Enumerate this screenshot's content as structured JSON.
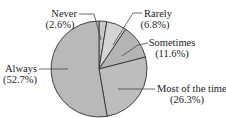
{
  "chart_data": {
    "type": "pie",
    "title": "",
    "categories": [
      "Never",
      "Rarely",
      "Sometimes",
      "Most of the time",
      "Always"
    ],
    "values": [
      2.6,
      6.8,
      11.6,
      26.3,
      52.7
    ],
    "unit": "%",
    "start_angle": "top (12 o'clock)",
    "direction": "clockwise",
    "colors": [
      "#c8c8c8",
      "#d4d4d4",
      "#b4b4b4",
      "#bdbdbd",
      "#b9b9b9"
    ],
    "edge_color": "#333333",
    "legend": "none (callout labels)",
    "labels": [
      {
        "name": "Never",
        "pct": "(2.6%)"
      },
      {
        "name": "Rarely",
        "pct": "(6.8%)"
      },
      {
        "name": "Sometimes",
        "pct": "(11.6%)"
      },
      {
        "name": "Most of the time",
        "pct": "(26.3%)"
      },
      {
        "name": "Always",
        "pct": "(52.7%)"
      }
    ]
  }
}
